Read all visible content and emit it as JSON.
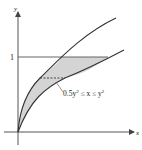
{
  "diagram": {
    "axes": {
      "x_label": "x",
      "y_label": "y"
    },
    "tick_label_y": "1",
    "annotation": {
      "prefix": "0.5y",
      "sup1": "2",
      "middle": " ≤ x ≤ y",
      "sup2": "2"
    },
    "colors": {
      "line": "#333333",
      "fill": "#d4d4d4",
      "axis": "#555555"
    }
  }
}
